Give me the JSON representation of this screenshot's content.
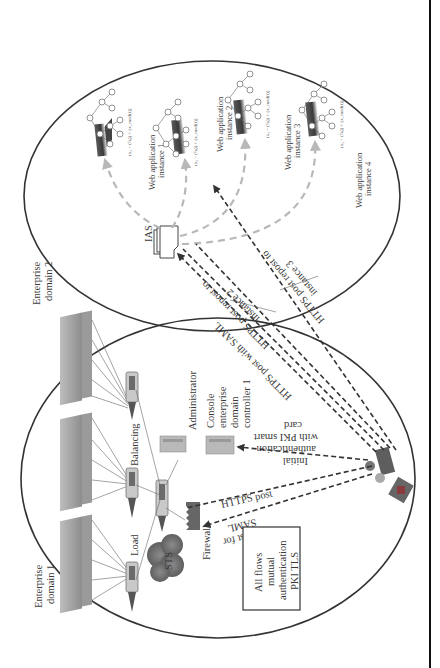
{
  "diagram": {
    "orientation": "rotated-90-ccw",
    "domain1": {
      "label_line1": "Enterprise",
      "label_line2": "domain 1",
      "load_balancing_label_1": "Load",
      "load_balancing_label_2": "Balancing",
      "sts_label": "STS",
      "firewall_label": "Firewall",
      "administrator_label": "Administrator",
      "console_label_line1": "Console",
      "console_label_line2": "enterprise",
      "console_label_line3": "domain",
      "console_label_line4": "controller 1"
    },
    "domain2": {
      "label_line1": "Enterprise",
      "label_line2": "domain 2",
      "ias_label": "IAS",
      "web_apps": [
        {
          "line1": "",
          "line2": ""
        },
        {
          "line1": "Web application",
          "line2": "instance 1"
        },
        {
          "line1": "Web application",
          "line2": "instance 2"
        },
        {
          "line1": "Web application",
          "line2": "instance 3"
        },
        {
          "line1": "Web application",
          "line2": "instance 4"
        }
      ],
      "formula": "(x₂ − (ⁱ⁄ₙ)) + (x_mod(t))"
    },
    "flows": {
      "https_post": "HTTPS post",
      "request_for_saml_line1": "Request for",
      "request_for_saml_line2": "SAML",
      "initial_auth_line1": "Initial",
      "initial_auth_line2": "authentication",
      "initial_auth_line3": "with PKI smart",
      "initial_auth_line4": "card",
      "https_post_saml": "HTTPS post with SAML",
      "repost_instance2_line1": "HTTPS post repost to",
      "repost_instance2_line2": "instance 2",
      "repost_instance3_line1": "HTTPS post repost to",
      "repost_instance3_line2": "instance 3"
    },
    "note_box": {
      "line1": "All flows",
      "line2": "mutual",
      "line3": "authentication",
      "line4": "PKI TLS"
    }
  }
}
